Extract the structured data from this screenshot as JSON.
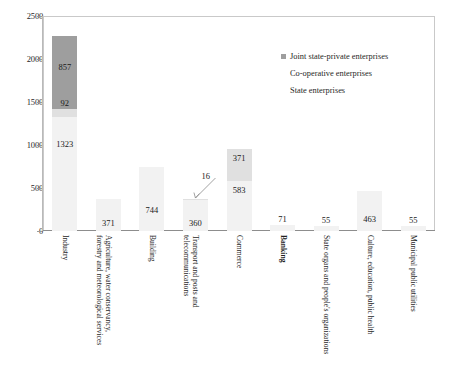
{
  "chart_data": {
    "type": "bar",
    "title": "",
    "xlabel": "",
    "ylabel": "",
    "ylim": [
      0,
      2500
    ],
    "yticks": [
      "0",
      "500",
      "1000",
      "1500",
      "2000",
      "2500"
    ],
    "grid": false,
    "stacked": true,
    "legend_position": "top-right",
    "categories": [
      "Industry",
      "Agriculture, water conservancy, forestry and meteorological services",
      "Building",
      "Transport and posts and telecommunications",
      "Commerce",
      "Banking",
      "State organs and people's organizations",
      "Culture, education, public health",
      "Municipal public utilities"
    ],
    "categories_bold": [
      false,
      false,
      false,
      false,
      false,
      true,
      false,
      false,
      false
    ],
    "series": [
      {
        "name": "State enterprises",
        "color": "#f2f2f2",
        "values": [
          1323,
          371,
          744,
          360,
          583,
          71,
          55,
          463,
          55
        ]
      },
      {
        "name": "Co-operative enterprises",
        "color": "#e0e0e0",
        "values": [
          92,
          0,
          0,
          16,
          371,
          0,
          0,
          0,
          0
        ]
      },
      {
        "name": "Joint state-private enterprises",
        "color": "#9e9e9e",
        "values": [
          857,
          0,
          0,
          0,
          0,
          0,
          0,
          0,
          0
        ]
      }
    ],
    "data_labels": [
      {
        "text": "857",
        "category": "Industry",
        "series": "Joint state-private enterprises"
      },
      {
        "text": "92",
        "category": "Industry",
        "series": "Co-operative enterprises"
      },
      {
        "text": "1323",
        "category": "Industry",
        "series": "State enterprises"
      },
      {
        "text": "371",
        "category": "Agriculture, water conservancy, forestry and meteorological services",
        "series": "State enterprises"
      },
      {
        "text": "744",
        "category": "Building",
        "series": "State enterprises"
      },
      {
        "text": "16",
        "category": "Transport and posts and telecommunications",
        "series": "Co-operative enterprises"
      },
      {
        "text": "360",
        "category": "Transport and posts and telecommunications",
        "series": "State enterprises"
      },
      {
        "text": "371",
        "category": "Commerce",
        "series": "Co-operative enterprises"
      },
      {
        "text": "583",
        "category": "Commerce",
        "series": "State enterprises"
      },
      {
        "text": "71",
        "category": "Banking",
        "series": "State enterprises"
      },
      {
        "text": "55",
        "category": "State organs and people's organizations",
        "series": "State enterprises"
      },
      {
        "text": "463",
        "category": "Culture, education, public health",
        "series": "State enterprises"
      },
      {
        "text": "55",
        "category": "Municipal public utilities",
        "series": "State enterprises"
      }
    ]
  },
  "legend": {
    "items": [
      {
        "label": "Joint state-private enterprises",
        "swatch": "joint"
      },
      {
        "label": "Co-operative enterprises",
        "swatch": "coop"
      },
      {
        "label": "State enterprises",
        "swatch": "state"
      }
    ]
  },
  "caption": {
    "text": ""
  }
}
